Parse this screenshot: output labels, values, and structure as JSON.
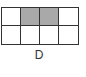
{
  "figure": {
    "label": "D",
    "grid": {
      "rows": 2,
      "cols": 4,
      "shaded_cells": [
        [
          0,
          1
        ],
        [
          0,
          2
        ]
      ],
      "shade_color": "#a9a9a9",
      "line_color": "#333333"
    }
  }
}
